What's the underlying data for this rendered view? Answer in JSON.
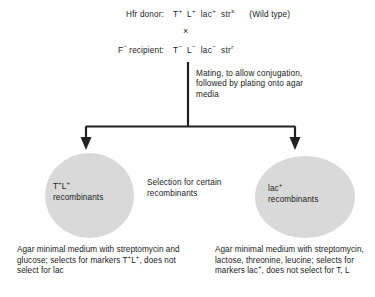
{
  "diagram": {
    "cross": {
      "donor": {
        "label": "Hfr donor:",
        "markers": [
          {
            "gene": "T",
            "charge": "+"
          },
          {
            "gene": "L",
            "charge": "+"
          },
          {
            "gene": "lac",
            "charge": "+"
          },
          {
            "gene": "str",
            "charge": "s"
          }
        ],
        "note": "(Wild type)"
      },
      "cross_symbol": "×",
      "recipient": {
        "label_gene": "F",
        "label_charge": "−",
        "label_rest": " recipient:",
        "markers": [
          {
            "gene": "T",
            "charge": "−"
          },
          {
            "gene": "L",
            "charge": "−"
          },
          {
            "gene": "lac",
            "charge": "−"
          },
          {
            "gene": "str",
            "charge": "r"
          }
        ]
      }
    },
    "mating_step": "Mating, to allow conjugation, followed by plating onto agar media",
    "selection_note": "Selection for  certain recombinants",
    "left_plate": {
      "label_markers": [
        {
          "gene": "T",
          "charge": "+"
        },
        {
          "gene": "L",
          "charge": "+"
        }
      ],
      "label_text": "recombinants",
      "caption_part1": "Agar minimal medium with streptomycin and glucose; selects for markers ",
      "caption_markers": [
        {
          "gene": "T",
          "charge": "+"
        },
        {
          "gene": "L",
          "charge": "+"
        }
      ],
      "caption_part2": ", does not select for lac"
    },
    "right_plate": {
      "label_gene": "lac",
      "label_charge": "+",
      "label_text": "recombinants",
      "caption_part1": "Agar minimal medium with streptomycin, lactose, threonine, leucine; selects for markers ",
      "caption_markers": [
        {
          "gene": "lac",
          "charge": "+"
        }
      ],
      "caption_part2": ", does not select for T, L"
    },
    "colors": {
      "plate_fill": "#d9d9d9",
      "line": "#222222",
      "text": "#1a1a1a",
      "background": "#ffffff"
    }
  }
}
